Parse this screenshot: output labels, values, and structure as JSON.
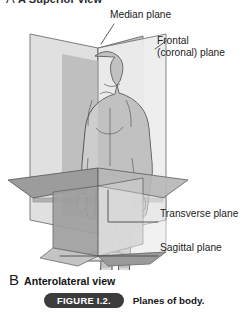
{
  "figure": {
    "cut_off_heading": "A Superior view",
    "view_label_letter": "B",
    "view_label_text": "Anterolateral view",
    "caption_tag": "FIGURE I.2.",
    "caption_text": "Planes of body.",
    "labels": {
      "median": "Median plane",
      "frontal_line1": "Frontal",
      "frontal_line2": "(coronal) plane",
      "transverse": "Transverse plane",
      "sagittal": "Sagittal plane"
    },
    "colors": {
      "plane_light": "#e3e3e3",
      "plane_mid": "#c9c9c9",
      "plane_dark": "#a8a8a8",
      "plane_darkest": "#8f8f8f",
      "body_fill": "#dcdcdc",
      "outline": "#555555",
      "leader": "#4a4a4a",
      "caption_pill": "#3c3c3c",
      "text": "#1a1a1a"
    }
  }
}
